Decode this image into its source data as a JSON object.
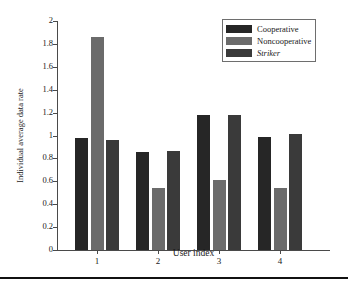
{
  "chart_data": {
    "type": "bar",
    "title": "",
    "xlabel": "User index",
    "ylabel": "Individual average data rate",
    "categories": [
      "1",
      "2",
      "3",
      "4"
    ],
    "ylim": [
      0,
      2
    ],
    "yticks": [
      "0",
      "0.2",
      "0.4",
      "0.6",
      "0.8",
      "1",
      "1.2",
      "1.4",
      "1.6",
      "1.8",
      "2"
    ],
    "ytick_values": [
      0,
      0.2,
      0.4,
      0.6,
      0.8,
      1,
      1.2,
      1.4,
      1.6,
      1.8,
      2
    ],
    "grid": false,
    "legend_position": "top-right",
    "series": [
      {
        "name": "Cooperative",
        "color": "#262626",
        "italic": false,
        "values": [
          0.98,
          0.855,
          1.175,
          0.985
        ]
      },
      {
        "name": "Noncooperative",
        "color": "#6b6b6b",
        "italic": false,
        "values": [
          1.86,
          0.54,
          0.61,
          0.545
        ]
      },
      {
        "name": "Striker",
        "color": "#3a3a3a",
        "italic": true,
        "values": [
          0.96,
          0.865,
          1.18,
          1.01
        ]
      }
    ]
  },
  "colors": {
    "axis": "#4a4a4a",
    "text": "#1a1a1a",
    "background": "#ffffff",
    "legend_border": "#6e6e6e",
    "rule": "#111111"
  }
}
